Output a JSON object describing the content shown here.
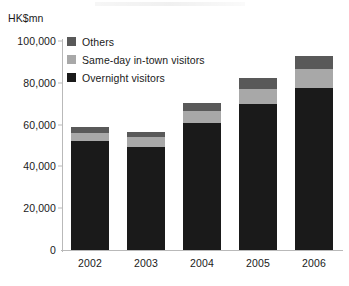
{
  "axis_unit_label": "HK$mn",
  "legend": {
    "items": [
      {
        "label": "Others",
        "color": "#595959"
      },
      {
        "label": "Same-day in-town visitors",
        "color": "#a8a8a8"
      },
      {
        "label": "Overnight visitors",
        "color": "#1a1a1a"
      }
    ]
  },
  "yticks": [
    {
      "label": "100,000",
      "value": 100000
    },
    {
      "label": "80,000",
      "value": 80000
    },
    {
      "label": "60,000",
      "value": 60000
    },
    {
      "label": "40,000",
      "value": 40000
    },
    {
      "label": "20,000",
      "value": 20000
    },
    {
      "label": "0",
      "value": 0
    }
  ],
  "xticks": [
    "2002",
    "2003",
    "2004",
    "2005",
    "2006"
  ],
  "chart_data": {
    "type": "bar",
    "stacked": true,
    "title": "",
    "subtitle": "",
    "xlabel": "",
    "ylabel": "HK$mn",
    "ylim": [
      0,
      100000
    ],
    "ytick_values": [
      0,
      20000,
      40000,
      60000,
      80000,
      100000
    ],
    "grid": false,
    "legend_position": "top-left",
    "categories": [
      "2002",
      "2003",
      "2004",
      "2005",
      "2006"
    ],
    "series": [
      {
        "name": "Overnight visitors",
        "color": "#1a1a1a",
        "values": [
          52000,
          49500,
          61000,
          70000,
          77500
        ]
      },
      {
        "name": "Same-day in-town visitors",
        "color": "#a8a8a8",
        "values": [
          4000,
          4500,
          5500,
          7000,
          9000
        ]
      },
      {
        "name": "Others",
        "color": "#595959",
        "values": [
          3000,
          2500,
          4000,
          5500,
          6500
        ]
      }
    ],
    "totals": [
      59000,
      56500,
      70500,
      82500,
      93000
    ]
  }
}
